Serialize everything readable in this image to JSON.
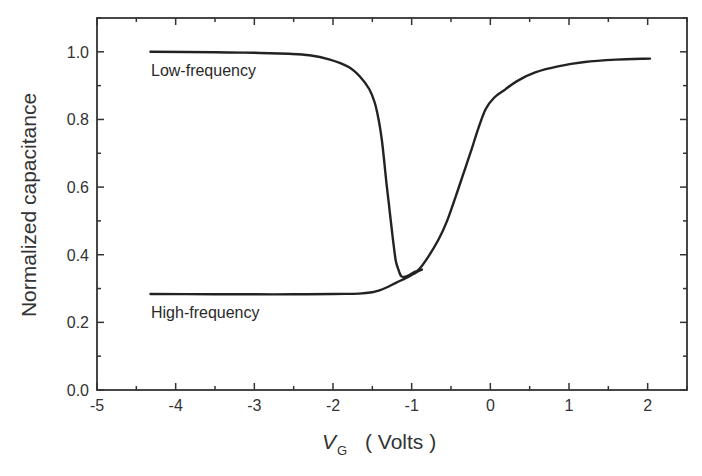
{
  "chart_data": {
    "type": "line",
    "title": "",
    "xlabel": "V_G ( Volts )",
    "xlabel_main": "V",
    "xlabel_sub": "G",
    "xlabel_unit": "( Volts )",
    "ylabel": "Normalized capacitance",
    "xlim": [
      -5,
      2.5
    ],
    "ylim": [
      0,
      1.1
    ],
    "xticks": [
      -5,
      -4,
      -3,
      -2,
      -1,
      0,
      1,
      2
    ],
    "xtick_labels": [
      "-5",
      "-4",
      "-3",
      "-2",
      "-1",
      "0",
      "1",
      "2"
    ],
    "yticks": [
      0.0,
      0.2,
      0.4,
      0.6,
      0.8,
      1.0
    ],
    "ytick_labels": [
      "0.0",
      "0.2",
      "0.4",
      "0.6",
      "0.8",
      "1.0"
    ],
    "grid": false,
    "legend": "none (inline annotations)",
    "annotations": [
      {
        "text": "Low-frequency",
        "x": -4.32,
        "y": 0.95
      },
      {
        "text": "High-frequency",
        "x": -4.32,
        "y": 0.23
      }
    ],
    "series": [
      {
        "name": "Low-frequency",
        "color": "#222222",
        "x": [
          -4.32,
          -3.5,
          -3.0,
          -2.56,
          -2.3,
          -2.05,
          -1.8,
          -1.65,
          -1.54,
          -1.47,
          -1.42,
          -1.38,
          -1.35,
          -1.32,
          -1.29,
          -1.26,
          -1.23,
          -1.2,
          -1.16,
          -1.13,
          -1.08,
          -1.03,
          -0.97,
          -0.91,
          -0.8,
          -0.66,
          -0.55,
          -0.41,
          -0.32,
          -0.24,
          -0.15,
          -0.06,
          0.05,
          0.19,
          0.35,
          0.57,
          0.86,
          1.2,
          1.6,
          2.03
        ],
        "y": [
          1.0,
          0.999,
          0.997,
          0.994,
          0.99,
          0.978,
          0.955,
          0.925,
          0.89,
          0.85,
          0.8,
          0.74,
          0.68,
          0.61,
          0.55,
          0.49,
          0.43,
          0.38,
          0.35,
          0.336,
          0.335,
          0.34,
          0.348,
          0.356,
          0.39,
          0.444,
          0.5,
          0.593,
          0.655,
          0.711,
          0.775,
          0.83,
          0.865,
          0.889,
          0.915,
          0.939,
          0.957,
          0.97,
          0.977,
          0.98
        ]
      },
      {
        "name": "High-frequency",
        "color": "#222222",
        "x": [
          -4.32,
          -3.5,
          -3.0,
          -2.5,
          -2.0,
          -1.67,
          -1.5,
          -1.42,
          -1.32,
          -1.2,
          -1.1,
          -1.04,
          -0.97,
          -0.91,
          -0.87
        ],
        "y": [
          0.284,
          0.283,
          0.283,
          0.283,
          0.284,
          0.285,
          0.289,
          0.294,
          0.303,
          0.317,
          0.328,
          0.335,
          0.344,
          0.352,
          0.356
        ]
      }
    ]
  }
}
